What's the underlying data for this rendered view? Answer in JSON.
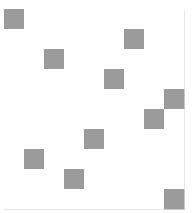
{
  "figure": {
    "background_color": "#ffffff",
    "plot_origin_x": 4,
    "plot_origin_y": 9,
    "cell_size": 20
  },
  "chart_data": {
    "type": "heatmap",
    "title": "",
    "subtitle": "",
    "xlabel": "",
    "ylabel": "",
    "grid": true,
    "legend": "none",
    "n_columns": 9,
    "n_rows": 10,
    "xlim": [
      0,
      9
    ],
    "ylim": [
      0,
      10
    ],
    "tick_labels_x": [],
    "tick_labels_y": [],
    "value_scale": {
      "empty": 0,
      "filled": 1
    },
    "colors": {
      "empty": "#ffffff",
      "filled": "#9b9b9b",
      "gridline": "#e9e9e9"
    },
    "filled_cells": [
      {
        "row": 0,
        "col": 0
      },
      {
        "row": 1,
        "col": 6
      },
      {
        "row": 2,
        "col": 2
      },
      {
        "row": 3,
        "col": 5
      },
      {
        "row": 4,
        "col": 8
      },
      {
        "row": 5,
        "col": 7
      },
      {
        "row": 6,
        "col": 4
      },
      {
        "row": 7,
        "col": 1
      },
      {
        "row": 8,
        "col": 3
      },
      {
        "row": 9,
        "col": 8
      }
    ],
    "matrix": [
      [
        1,
        0,
        0,
        0,
        0,
        0,
        0,
        0,
        0
      ],
      [
        0,
        0,
        0,
        0,
        0,
        0,
        1,
        0,
        0
      ],
      [
        0,
        0,
        1,
        0,
        0,
        0,
        0,
        0,
        0
      ],
      [
        0,
        0,
        0,
        0,
        0,
        1,
        0,
        0,
        0
      ],
      [
        0,
        0,
        0,
        0,
        0,
        0,
        0,
        0,
        1
      ],
      [
        0,
        0,
        0,
        0,
        0,
        0,
        0,
        1,
        0
      ],
      [
        0,
        0,
        0,
        0,
        1,
        0,
        0,
        0,
        0
      ],
      [
        0,
        1,
        0,
        0,
        0,
        0,
        0,
        0,
        0
      ],
      [
        0,
        0,
        0,
        1,
        0,
        0,
        0,
        0,
        0
      ],
      [
        0,
        0,
        0,
        0,
        0,
        0,
        0,
        0,
        1
      ]
    ]
  }
}
